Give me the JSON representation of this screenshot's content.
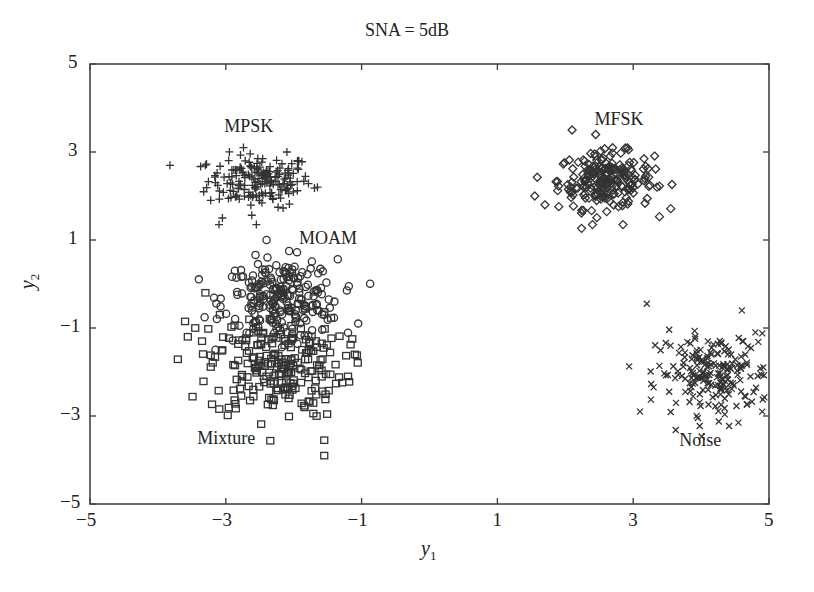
{
  "chart_data": {
    "type": "scatter",
    "title": "SNA = 5dB",
    "xlabel": "y",
    "xlabel_sub": "1",
    "ylabel": "y",
    "ylabel_sub": "2",
    "xlim": [
      -5,
      5
    ],
    "ylim": [
      -5,
      5
    ],
    "xticks": [
      -5,
      -3,
      -1,
      1,
      3,
      5
    ],
    "yticks": [
      -5,
      -3,
      -1,
      1,
      3,
      5
    ],
    "xtick_labels": [
      "−5",
      "−3",
      "−1",
      "1",
      "3",
      "5"
    ],
    "ytick_labels": [
      "−5",
      "−3",
      "−1",
      "1",
      "3",
      "5"
    ],
    "grid": false,
    "legend": "none (inline cluster labels)",
    "series": [
      {
        "name": "MPSK",
        "marker": "plus",
        "center": [
          -2.5,
          2.35
        ],
        "spread": [
          0.38,
          0.3
        ],
        "count": 180,
        "label_pos": [
          -2.55,
          3.55
        ]
      },
      {
        "name": "MFSK",
        "marker": "diamond",
        "center": [
          2.6,
          2.35
        ],
        "spread": [
          0.35,
          0.32
        ],
        "count": 220,
        "label_pos": [
          2.9,
          3.7
        ]
      },
      {
        "name": "MOAM",
        "marker": "circle",
        "center": [
          -2.2,
          -0.35
        ],
        "spread": [
          0.42,
          0.45
        ],
        "count": 230,
        "label_pos": [
          -1.45,
          1.0
        ]
      },
      {
        "name": "Mixture",
        "marker": "square",
        "center": [
          -2.25,
          -1.85
        ],
        "spread": [
          0.5,
          0.6
        ],
        "count": 230,
        "label_pos": [
          -2.95,
          -3.55
        ]
      },
      {
        "name": "Noise",
        "marker": "x",
        "center": [
          4.2,
          -2.05
        ],
        "spread": [
          0.42,
          0.45
        ],
        "count": 200,
        "label_pos": [
          4.15,
          -3.6
        ]
      }
    ],
    "outliers": {
      "MPSK": [
        [
          -3.3,
          2.7
        ],
        [
          -3.05,
          1.5
        ],
        [
          -2.55,
          1.35
        ],
        [
          -2.1,
          3.0
        ],
        [
          -1.65,
          2.2
        ],
        [
          -3.1,
          1.35
        ]
      ],
      "MFSK": [
        [
          2.1,
          3.5
        ],
        [
          1.55,
          2.0
        ],
        [
          1.7,
          1.8
        ],
        [
          3.35,
          2.2
        ],
        [
          2.4,
          1.35
        ],
        [
          2.85,
          1.35
        ]
      ],
      "MOAM": [
        [
          -2.4,
          1.0
        ],
        [
          -1.05,
          -0.9
        ],
        [
          -1.4,
          -0.4
        ],
        [
          -1.75,
          0.35
        ]
      ],
      "Mixture": [
        [
          -3.3,
          -0.2
        ],
        [
          -3.6,
          -0.85
        ],
        [
          -3.35,
          -1.3
        ],
        [
          -1.55,
          -3.9
        ],
        [
          -1.55,
          -3.55
        ],
        [
          -1.1,
          -1.6
        ],
        [
          -1.2,
          -2.1
        ],
        [
          -3.45,
          -1.0
        ]
      ],
      "Noise": [
        [
          3.2,
          -0.45
        ],
        [
          3.1,
          -2.9
        ],
        [
          3.3,
          -2.35
        ],
        [
          4.6,
          -0.6
        ],
        [
          4.8,
          -1.1
        ],
        [
          4.9,
          -2.9
        ],
        [
          4.55,
          -3.15
        ],
        [
          3.55,
          -1.4
        ]
      ]
    },
    "colors": {
      "markers": "#333333",
      "axes": "#444444",
      "background": "#ffffff"
    }
  },
  "labels": {
    "title": "SNA = 5dB"
  }
}
